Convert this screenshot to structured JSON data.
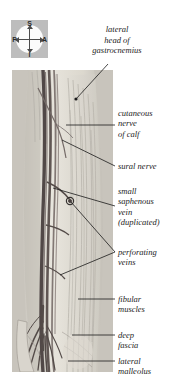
{
  "figure": {
    "title": "lateral head of gastrocnemius",
    "background_color": "#ffffff",
    "photo_tint": "#cfcfcb"
  },
  "compass": {
    "name": "orientation-compass",
    "box_color": "#bdbdbd",
    "disc_color": "#fbfbfb",
    "superior": "S",
    "inferior": "I",
    "posterior": "P",
    "anterior": "A"
  },
  "heading": {
    "line1": "lateral",
    "line2": "head of",
    "line3": "gastrocnemius",
    "full": "lateral head of gastrocnemius"
  },
  "callouts": [
    {
      "id": "cutaneous-nerve-of-calf",
      "line1": "cutaneous",
      "line2": "nerve",
      "line3": "of calf",
      "full": "cutaneous nerve of calf"
    },
    {
      "id": "sural-nerve",
      "line1": "sural nerve",
      "full": "sural nerve"
    },
    {
      "id": "small-saphenous-vein",
      "line1": "small",
      "line2": "saphenous",
      "line3": "vein",
      "line4": "(duplicated)",
      "full": "small saphenous vein (duplicated)"
    },
    {
      "id": "perforating-veins",
      "line1": "perforating",
      "line2": "veins",
      "full": "perforating veins"
    },
    {
      "id": "fibular-muscles",
      "line1": "fibular",
      "line2": "muscles",
      "full": "fibular muscles"
    },
    {
      "id": "deep-fascia",
      "line1": "deep",
      "line2": "fascia",
      "full": "deep fascia"
    },
    {
      "id": "lateral-malleolus",
      "line1": "lateral",
      "line2": "malleolus",
      "full": "lateral malleolus"
    }
  ],
  "colors": {
    "leader_line": "#1a1a1a",
    "vessel_dark": "#4a4140",
    "vessel_mid": "#6d625f",
    "tissue_light": "#e8e6e0",
    "tissue_mid": "#d4d0c8",
    "text": "#1c1c1c"
  }
}
